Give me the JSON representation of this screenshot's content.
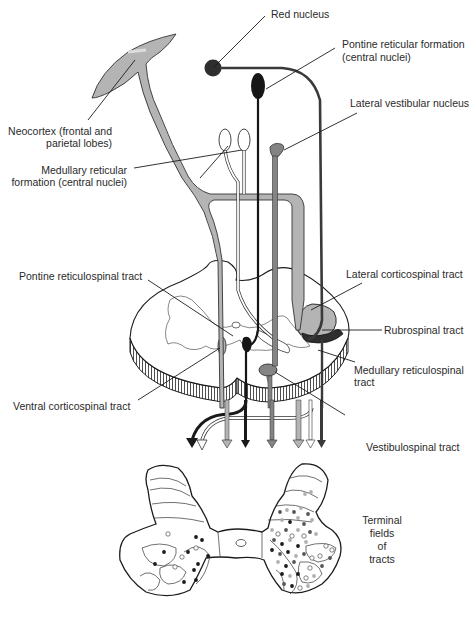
{
  "figure": {
    "type": "neuroanatomy-diagram"
  },
  "colors": {
    "cortex_gray": "#b4b4b4",
    "red_nucleus": "#2e2e2e",
    "pontine_dark": "#161616",
    "vestibular_mid": "#848484",
    "outline": "#1c1c1c",
    "dot_black": "#1a1a1a",
    "dot_dark": "#555555",
    "dot_light": "#b0b0b0",
    "dot_open": "#ffffff"
  },
  "labels": {
    "red_nucleus": "Red nucleus",
    "pontine_rf_1": "Pontine reticular formation",
    "pontine_rf_2": "(central nuclei)",
    "lateral_vestibular": "Lateral vestibular nucleus",
    "neocortex_1": "Neocortex (frontal and",
    "neocortex_2": "parietal lobes)",
    "medullary_rf_1": "Medullary reticular",
    "medullary_rf_2": "formation (central nuclei)",
    "pontine_rst": "Pontine reticulospinal tract",
    "lateral_cst": "Lateral corticospinal tract",
    "rubrospinal": "Rubrospinal tract",
    "medullary_rst_1": "Medullary reticulospinal",
    "medullary_rst_2": "tract",
    "ventral_cst": "Ventral corticospinal tract",
    "vestibulospinal": "Vestibulospinal tract",
    "terminal_1": "Terminal",
    "terminal_2": "fields",
    "terminal_3": "of",
    "terminal_4": "tracts"
  },
  "structures": [
    {
      "name": "Neocortex (frontal and parietal lobes)",
      "shade": "light gray"
    },
    {
      "name": "Red nucleus",
      "shade": "dark"
    },
    {
      "name": "Pontine reticular formation (central nuclei)",
      "shade": "black"
    },
    {
      "name": "Lateral vestibular nucleus",
      "shade": "medium gray"
    },
    {
      "name": "Medullary reticular formation (central nuclei)",
      "shade": "white/outline"
    }
  ],
  "tracts": [
    "Lateral corticospinal tract",
    "Ventral corticospinal tract",
    "Rubrospinal tract",
    "Pontine reticulospinal tract",
    "Medullary reticulospinal tract",
    "Vestibulospinal tract"
  ]
}
